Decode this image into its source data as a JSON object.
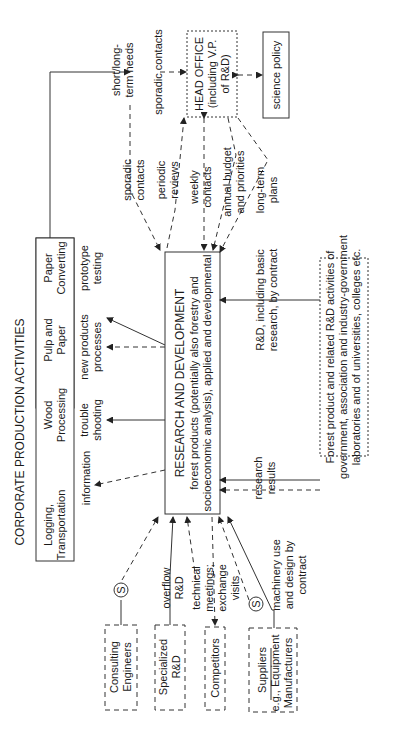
{
  "diagram": {
    "title": "CORPORATE PRODUCTION ACTIVITIES",
    "production_box": {
      "columns": [
        {
          "line1": "Logging,",
          "line2": "Transportation"
        },
        {
          "line1": "Wood",
          "line2": "Processing"
        },
        {
          "line1": "Pulp and",
          "line2": "Paper"
        },
        {
          "line1": "Paper",
          "line2": "Converting"
        }
      ]
    },
    "rd_box": {
      "title": "RESEARCH AND DEVELOPMENT",
      "line2": "forest products (potentially also forestry and",
      "line3": "socioeconomic analysis), applied and developmental"
    },
    "head_office": {
      "line1": "HEAD OFFICE",
      "line2": "(including V.P.",
      "line3": "of R&D)"
    },
    "science_policy": "science policy",
    "external_box": {
      "line1": "Forest product and related R&D activities of",
      "line2": "government, association and industry-government",
      "line3": "laboratories and of universities, colleges etc."
    },
    "left_boxes": [
      {
        "line1": "Consulting",
        "line2": "Engineers"
      },
      {
        "line1": "Specialized",
        "line2": "R&D"
      },
      {
        "line1": "Competitors"
      },
      {
        "line1": "Suppliers",
        "line2": "e.g., Equipment",
        "line3": "Manufacturers"
      }
    ],
    "s_marker": "S",
    "flow_labels": {
      "information": "information",
      "trouble_shooting": [
        "trouble",
        "shooting"
      ],
      "new_products": [
        "new products",
        "processes"
      ],
      "prototype_testing": [
        "prototype",
        "testing"
      ],
      "short_long_term": [
        "short/long-",
        "term needs"
      ],
      "sporadic_contacts_top": "sporadic contacts",
      "sporadic_contacts": [
        "sporadic",
        "contacts"
      ],
      "periodic_reviews": [
        "periodic",
        "reviews"
      ],
      "weekly_contacts": [
        "weekly",
        "contacts"
      ],
      "annual_budget": [
        "annual budget",
        "and priorities"
      ],
      "long_term_plans": [
        "long-term",
        "plans"
      ],
      "rd_by_contract": [
        "R&D, including basic",
        "research, by contract"
      ],
      "research_results": [
        "research",
        "results"
      ],
      "overflow_rd": [
        "overflow",
        "R&D"
      ],
      "technical_meetings": [
        "technical",
        "meetings;",
        "exchange",
        "visits"
      ],
      "machinery_use": [
        "machinery use",
        "and design by",
        "contract"
      ]
    }
  }
}
